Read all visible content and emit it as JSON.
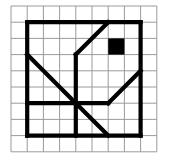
{
  "figure": {
    "kind": "grid-line-drawing",
    "canvas": {
      "width": 177,
      "height": 159,
      "background": "#ffffff"
    },
    "grid": {
      "columns": 9,
      "rows": 9,
      "origin_x": 11,
      "origin_y": 6,
      "cell_size": 16.2,
      "line_color": "#9a9a9a",
      "line_width": 1
    },
    "shape": {
      "stroke_color": "#000000",
      "stroke_width": 4.2,
      "fill_color": "#000000",
      "filled_cells": [
        {
          "col": 6,
          "row": 2,
          "width": 1,
          "height": 1
        }
      ],
      "segments": [
        {
          "name": "outer-top-edge",
          "x1": 1,
          "y1": 1,
          "x2": 8,
          "y2": 1
        },
        {
          "name": "outer-right-edge",
          "x1": 8,
          "y1": 1,
          "x2": 8,
          "y2": 8
        },
        {
          "name": "outer-bottom-edge",
          "x1": 8,
          "y1": 8,
          "x2": 1,
          "y2": 8
        },
        {
          "name": "outer-left-edge",
          "x1": 1,
          "y1": 8,
          "x2": 1,
          "y2": 1
        },
        {
          "name": "upper-diagonal",
          "x1": 6,
          "y1": 1,
          "x2": 4,
          "y2": 3
        },
        {
          "name": "upper-vertical-stem",
          "x1": 4,
          "y1": 3,
          "x2": 4,
          "y2": 6
        },
        {
          "name": "left-diagonal",
          "x1": 1,
          "y1": 3,
          "x2": 4,
          "y2": 6
        },
        {
          "name": "left-horizontal",
          "x1": 1,
          "y1": 6,
          "x2": 4,
          "y2": 6
        },
        {
          "name": "right-diagonal",
          "x1": 8,
          "y1": 4,
          "x2": 6,
          "y2": 6
        },
        {
          "name": "right-horizontal",
          "x1": 6,
          "y1": 6,
          "x2": 4,
          "y2": 6
        },
        {
          "name": "lower-diagonal",
          "x1": 4,
          "y1": 6,
          "x2": 6,
          "y2": 8
        },
        {
          "name": "center-vertical-stem",
          "x1": 4,
          "y1": 6,
          "x2": 4,
          "y2": 8
        }
      ]
    }
  }
}
